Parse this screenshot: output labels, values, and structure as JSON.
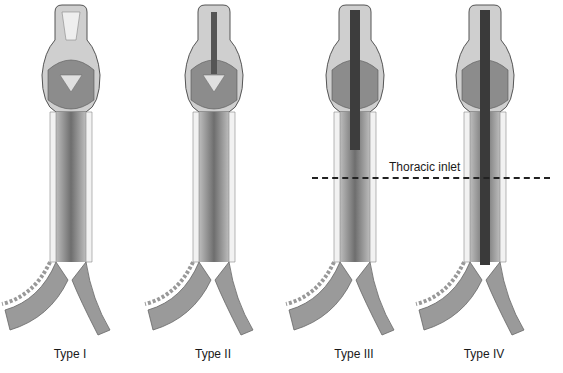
{
  "figure": {
    "panels": [
      {
        "label": "Type I",
        "cleft_extent": "supraglottic interarytenoid",
        "center_x": 70
      },
      {
        "label": "Type II",
        "cleft_extent": "partial cricoid",
        "center_x": 213
      },
      {
        "label": "Type III",
        "cleft_extent": "total cricoid into cervical trachea",
        "center_x": 354
      },
      {
        "label": "Type IV",
        "cleft_extent": "extends into thoracic trachea",
        "center_x": 484
      }
    ],
    "annotation": {
      "text": "Thoracic inlet",
      "line_style": "dashed"
    },
    "colors": {
      "background": "#ffffff",
      "tissue_dark": "#5a5a5a",
      "tissue_mid": "#8a8a8a",
      "tissue_light": "#d8d8d8",
      "cartilage": "#f2f2f2",
      "text": "#1a1a1a"
    }
  }
}
